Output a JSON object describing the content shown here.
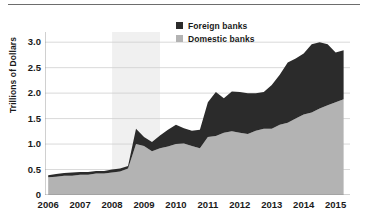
{
  "chart_data": {
    "type": "area",
    "stacked": true,
    "title": "",
    "subtitle": "",
    "xlabel": "",
    "ylabel": "Trillions of Dollars",
    "xlim": [
      2005.9,
      2015.45
    ],
    "ylim": [
      0,
      3.2
    ],
    "grid": true,
    "grid_axis": "y",
    "legend_position": "top-center",
    "y_ticks": [
      {
        "value": 3.0,
        "label": "3.0"
      },
      {
        "value": 2.5,
        "label": "2.5"
      },
      {
        "value": 2.0,
        "label": "2.0"
      },
      {
        "value": 1.5,
        "label": "1.5"
      },
      {
        "value": 1.0,
        "label": "1.0"
      },
      {
        "value": 0.5,
        "label": "0.5"
      },
      {
        "value": 0.0,
        "label": "0"
      }
    ],
    "x_ticks": [
      {
        "value": 2006,
        "label": "2006"
      },
      {
        "value": 2007,
        "label": "2007"
      },
      {
        "value": 2008,
        "label": "2008"
      },
      {
        "value": 2009,
        "label": "2009"
      },
      {
        "value": 2010,
        "label": "2010"
      },
      {
        "value": 2011,
        "label": "2011"
      },
      {
        "value": 2012,
        "label": "2012"
      },
      {
        "value": 2013,
        "label": "2013"
      },
      {
        "value": 2014,
        "label": "2014"
      },
      {
        "value": 2015,
        "label": "2015"
      }
    ],
    "shaded_regions": [
      {
        "name": "recession",
        "x_start": 2008.0,
        "x_end": 2009.5,
        "color": "#f0f0f0"
      }
    ],
    "colors": {
      "foreign_banks": "#2b2b2b",
      "domestic_banks": "#b3b3b3",
      "recession_band": "#f0f0f0",
      "gridline": "#cfcfcf",
      "text": "#1a1a1a",
      "top_rule": "#6d6d6d"
    },
    "x": [
      2006.0,
      2006.25,
      2006.5,
      2006.75,
      2007.0,
      2007.25,
      2007.5,
      2007.75,
      2008.0,
      2008.25,
      2008.5,
      2008.75,
      2009.0,
      2009.25,
      2009.5,
      2009.75,
      2010.0,
      2010.25,
      2010.5,
      2010.75,
      2011.0,
      2011.25,
      2011.5,
      2011.75,
      2012.0,
      2012.25,
      2012.5,
      2012.75,
      2013.0,
      2013.25,
      2013.5,
      2013.75,
      2014.0,
      2014.25,
      2014.5,
      2014.75,
      2015.0,
      2015.25
    ],
    "series": [
      {
        "name": "Domestic banks",
        "color": "#b3b3b3",
        "values": [
          0.35,
          0.36,
          0.38,
          0.38,
          0.4,
          0.4,
          0.42,
          0.42,
          0.44,
          0.46,
          0.52,
          1.0,
          0.96,
          0.86,
          0.92,
          0.95,
          1.0,
          1.01,
          0.96,
          0.92,
          1.14,
          1.16,
          1.22,
          1.25,
          1.22,
          1.2,
          1.26,
          1.3,
          1.3,
          1.38,
          1.42,
          1.5,
          1.58,
          1.62,
          1.7,
          1.76,
          1.82,
          1.88
        ]
      },
      {
        "name": "Foreign banks",
        "color": "#2b2b2b",
        "values": [
          0.04,
          0.05,
          0.05,
          0.06,
          0.05,
          0.05,
          0.05,
          0.05,
          0.06,
          0.06,
          0.05,
          0.3,
          0.18,
          0.18,
          0.25,
          0.33,
          0.38,
          0.3,
          0.3,
          0.36,
          0.68,
          0.86,
          0.68,
          0.78,
          0.8,
          0.8,
          0.74,
          0.72,
          0.86,
          0.98,
          1.18,
          1.18,
          1.2,
          1.34,
          1.3,
          1.2,
          0.98,
          0.96
        ]
      }
    ],
    "totals": [
      0.39,
      0.41,
      0.43,
      0.44,
      0.45,
      0.45,
      0.47,
      0.47,
      0.5,
      0.52,
      0.57,
      1.3,
      1.14,
      1.04,
      1.17,
      1.28,
      1.38,
      1.31,
      1.26,
      1.28,
      1.82,
      2.02,
      1.9,
      2.03,
      2.02,
      2.0,
      2.0,
      2.02,
      2.16,
      2.36,
      2.6,
      2.68,
      2.78,
      2.96,
      3.0,
      2.96,
      2.8,
      2.84
    ],
    "legend": [
      {
        "label": "Foreign banks",
        "color": "#2b2b2b"
      },
      {
        "label": "Domestic banks",
        "color": "#b3b3b3"
      }
    ]
  }
}
